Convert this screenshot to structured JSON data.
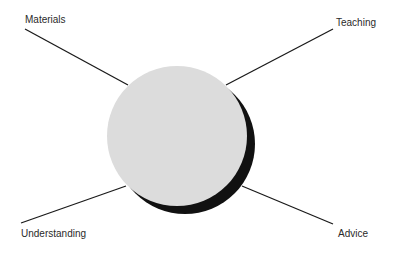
{
  "diagram": {
    "center": {
      "cx": 177,
      "cy": 136,
      "r": 70,
      "fill": "#dcdcdc",
      "shadow_color": "#111111",
      "shadow_dx": 8,
      "shadow_dy": 8
    },
    "spokes": [
      {
        "label": "Materials",
        "x1": 25,
        "y1": 29,
        "x2": 128,
        "y2": 85,
        "lx": 25,
        "ly": 14
      },
      {
        "label": "Teaching",
        "x1": 333,
        "y1": 29,
        "x2": 226,
        "y2": 85,
        "lx": 336,
        "ly": 17
      },
      {
        "label": "Understanding",
        "x1": 21,
        "y1": 223,
        "x2": 126,
        "y2": 186,
        "lx": 21,
        "ly": 228
      },
      {
        "label": "Advice",
        "x1": 242,
        "y1": 186,
        "x2": 333,
        "y2": 224,
        "lx": 338,
        "ly": 228
      }
    ],
    "line_color": "#1a1a1a"
  }
}
